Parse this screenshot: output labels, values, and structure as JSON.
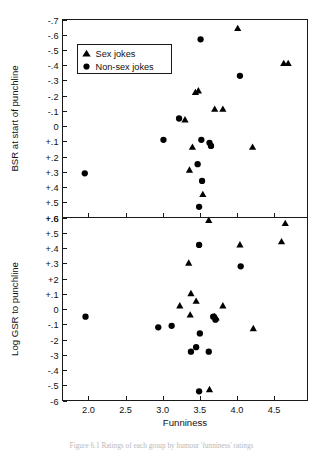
{
  "figure": {
    "caption": "Figure 6.1 Ratings of each group by humour 'funniness' ratings"
  },
  "legend": {
    "position": "top-left-inside-upper-panel",
    "entries": [
      {
        "marker": "triangle",
        "label": "Sex jokes"
      },
      {
        "marker": "circle",
        "label": "Non-sex jokes"
      }
    ]
  },
  "chart_data": [
    {
      "type": "scatter",
      "panel": "upper",
      "title": "",
      "xlabel": "",
      "ylabel": "BSR at start of punchline",
      "xlim": [
        1.65,
        4.95
      ],
      "ylim": [
        -0.7,
        0.6
      ],
      "y_inverted": true,
      "grid": false,
      "xticks": [
        2.0,
        2.5,
        3.0,
        3.5,
        4.0,
        4.5
      ],
      "xticklabels": [
        "2.0",
        "2.5",
        "3.0",
        "3.5",
        "4.0",
        "4.5"
      ],
      "yticks": [
        -0.7,
        -0.6,
        -0.5,
        -0.4,
        -0.3,
        -0.2,
        -0.1,
        0,
        0.1,
        0.2,
        0.3,
        0.4,
        0.5,
        0.6
      ],
      "yticklabels": [
        "-.7",
        "-.6",
        "-.5",
        "-.4",
        "-.3",
        "-.2",
        "-.1",
        "0",
        "+.1",
        "+.2",
        "+.3",
        "+.4",
        "+.5",
        "+.6"
      ],
      "series": [
        {
          "name": "Sex jokes",
          "marker": "triangle",
          "points": [
            [
              4.01,
              -0.64
            ],
            [
              4.63,
              -0.41
            ],
            [
              4.69,
              -0.41
            ],
            [
              3.44,
              -0.22
            ],
            [
              3.48,
              -0.23
            ],
            [
              3.7,
              -0.11
            ],
            [
              3.81,
              -0.11
            ],
            [
              3.3,
              -0.04
            ],
            [
              3.4,
              0.14
            ],
            [
              4.21,
              0.14
            ],
            [
              3.36,
              0.29
            ],
            [
              3.54,
              0.45
            ],
            [
              3.62,
              0.62
            ]
          ]
        },
        {
          "name": "Non-sex jokes",
          "marker": "circle",
          "points": [
            [
              3.51,
              -0.57
            ],
            [
              4.04,
              -0.33
            ],
            [
              3.22,
              -0.05
            ],
            [
              3.01,
              0.09
            ],
            [
              3.52,
              0.09
            ],
            [
              3.63,
              0.11
            ],
            [
              3.65,
              0.13
            ],
            [
              3.47,
              0.25
            ],
            [
              1.95,
              0.31
            ],
            [
              3.53,
              0.36
            ],
            [
              3.49,
              0.53
            ]
          ]
        }
      ]
    },
    {
      "type": "scatter",
      "panel": "lower",
      "title": "",
      "xlabel": "Funniness",
      "ylabel": "Log GSR to punchline",
      "xlim": [
        1.65,
        4.95
      ],
      "ylim": [
        -0.6,
        0.6
      ],
      "y_inverted": false,
      "grid": false,
      "xticks": [
        2.0,
        2.5,
        3.0,
        3.5,
        4.0,
        4.5
      ],
      "xticklabels": [
        "2.0",
        "2.5",
        "3.0",
        "3.5",
        "4.0",
        "4.5"
      ],
      "yticks": [
        0.6,
        0.5,
        0.4,
        0.3,
        0.2,
        0.1,
        0,
        -0.1,
        -0.2,
        -0.3,
        -0.4,
        -0.5,
        -0.6
      ],
      "yticklabels": [
        "+.6",
        "+.5",
        "+.4",
        "+.3",
        "+2",
        "+.1",
        "0",
        "-.1",
        "-2",
        "-3",
        "-.4",
        "-.5",
        "-6"
      ],
      "series": [
        {
          "name": "Sex jokes",
          "marker": "triangle",
          "points": [
            [
              4.65,
              0.56
            ],
            [
              4.6,
              0.44
            ],
            [
              4.04,
              0.42
            ],
            [
              3.35,
              0.3
            ],
            [
              3.38,
              0.1
            ],
            [
              3.45,
              0.05
            ],
            [
              3.23,
              0.02
            ],
            [
              3.81,
              0.02
            ],
            [
              3.37,
              -0.04
            ],
            [
              3.7,
              -0.05
            ],
            [
              3.72,
              -0.06
            ],
            [
              4.22,
              -0.13
            ],
            [
              3.63,
              -0.53
            ]
          ]
        },
        {
          "name": "Non-sex jokes",
          "marker": "circle",
          "points": [
            [
              3.49,
              0.42
            ],
            [
              4.05,
              0.28
            ],
            [
              1.96,
              -0.05
            ],
            [
              3.68,
              -0.05
            ],
            [
              3.71,
              -0.07
            ],
            [
              2.94,
              -0.12
            ],
            [
              3.12,
              -0.11
            ],
            [
              3.5,
              -0.16
            ],
            [
              3.45,
              -0.25
            ],
            [
              3.38,
              -0.28
            ],
            [
              3.62,
              -0.28
            ],
            [
              3.49,
              -0.54
            ]
          ]
        }
      ]
    }
  ]
}
